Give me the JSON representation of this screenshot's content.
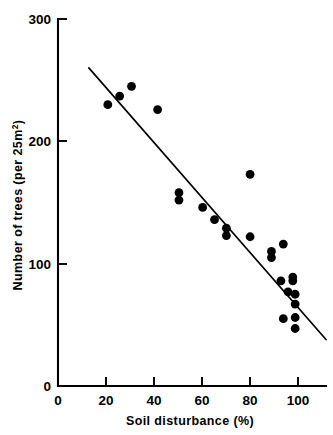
{
  "chart_data": {
    "type": "scatter",
    "title": "",
    "subtitle": "",
    "xlabel": "Soil disturbance (%)",
    "ylabel_main": "Number of trees  (per 25m",
    "ylabel_sup": "2",
    "ylabel_tail": ")",
    "ylabel_full": "Number of trees (per 25m²)",
    "xlim": [
      0,
      113
    ],
    "ylim": [
      0,
      300
    ],
    "xticks": [
      0,
      20,
      40,
      60,
      80,
      100
    ],
    "xtick_labels": [
      "0",
      "20",
      "40",
      "60",
      "80",
      "100"
    ],
    "yticks": [
      0,
      100,
      200,
      300
    ],
    "ytick_labels": [
      "0",
      "100",
      "200",
      "300"
    ],
    "grid": false,
    "legend": "none",
    "marker": "filled-circle",
    "marker_color": "#000000",
    "series": [
      {
        "name": "plots",
        "points": [
          {
            "x": 21,
            "y": 230
          },
          {
            "x": 26,
            "y": 237
          },
          {
            "x": 31,
            "y": 245
          },
          {
            "x": 42,
            "y": 226
          },
          {
            "x": 51,
            "y": 158
          },
          {
            "x": 51,
            "y": 152
          },
          {
            "x": 61,
            "y": 146
          },
          {
            "x": 66,
            "y": 136
          },
          {
            "x": 71,
            "y": 129
          },
          {
            "x": 71,
            "y": 123
          },
          {
            "x": 81,
            "y": 173
          },
          {
            "x": 81,
            "y": 122
          },
          {
            "x": 90,
            "y": 110
          },
          {
            "x": 90,
            "y": 105
          },
          {
            "x": 95,
            "y": 116
          },
          {
            "x": 94,
            "y": 86
          },
          {
            "x": 99,
            "y": 89
          },
          {
            "x": 99,
            "y": 86
          },
          {
            "x": 97,
            "y": 77
          },
          {
            "x": 100,
            "y": 75
          },
          {
            "x": 100,
            "y": 67
          },
          {
            "x": 95,
            "y": 55
          },
          {
            "x": 100,
            "y": 56
          },
          {
            "x": 100,
            "y": 47
          }
        ]
      }
    ],
    "fit_line": {
      "name": "regression line",
      "x1": 13,
      "y1": 260,
      "x2": 113,
      "y2": 38
    }
  }
}
